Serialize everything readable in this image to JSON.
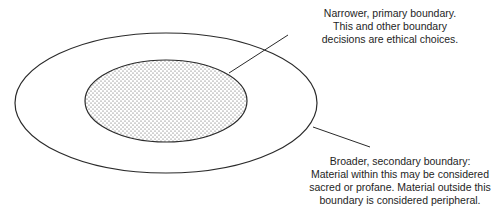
{
  "diagram": {
    "primary_label": {
      "lines": [
        "Narrower, primary boundary.",
        "This and other boundary",
        "decisions are ethical choices."
      ]
    },
    "secondary_label": {
      "lines": [
        "Broader, secondary boundary:",
        "Material within this may be considered",
        "sacred or profane. Material outside this",
        "boundary is considered peripheral."
      ]
    },
    "colors": {
      "stroke": "#2a2a2a",
      "stipple": "#4a4a4a",
      "background": "#ffffff"
    }
  }
}
